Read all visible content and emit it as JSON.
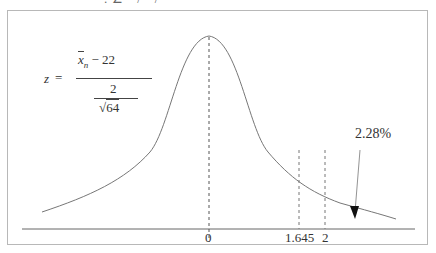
{
  "header": {
    "clipped_text": "· : ∠ · / · / ·"
  },
  "formula": {
    "lhs": "z",
    "equals": "=",
    "numerator_var": "x",
    "numerator_sub": "n",
    "numerator_rest": "− 22",
    "denominator_top": "2",
    "sqrt_symbol": "√",
    "sqrt_arg": "64"
  },
  "axis": {
    "tick_labels": [
      "0",
      "1.645",
      "2"
    ]
  },
  "annotation": {
    "tail_percent": "2.28%"
  },
  "colors": {
    "curve": "#6e6e6e",
    "axis": "#555555",
    "frame": "#b8b8b8",
    "arrow": "#111111"
  }
}
